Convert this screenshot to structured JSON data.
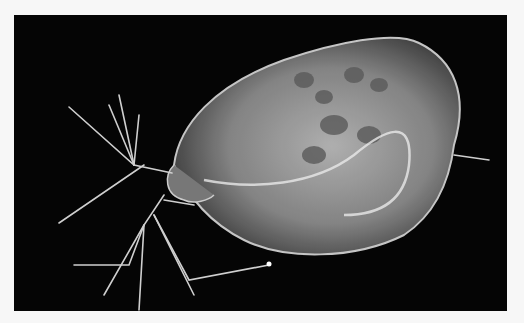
{
  "image": {
    "subject": "Daphnia (water flea) under dark-field microscopy",
    "background_color": "#050505",
    "frame_color": "#f7f7f7"
  }
}
